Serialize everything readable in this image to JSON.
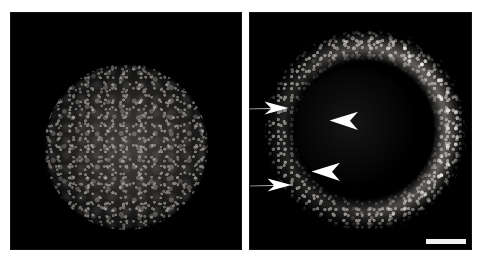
{
  "figure": {
    "caption_hidden": "",
    "background_color": "#ffffff",
    "width_px": 481,
    "height_px": 263
  },
  "panels": [
    {
      "id": "left",
      "data_name": "panel-left",
      "position_label": "left",
      "background_color": "#000000",
      "specimen": {
        "type": "solid-spheroid",
        "description": "densely packed fluorescently labelled nuclei filling the whole spheroid",
        "center_x_px": 125,
        "center_y_px": 145,
        "radius_px": 80,
        "signal_color": "#8a8682",
        "interior": "filled"
      },
      "markers": [],
      "scale_bar": null
    },
    {
      "id": "right",
      "data_name": "panel-right",
      "position_label": "right",
      "background_color": "#000000",
      "specimen": {
        "type": "hollow-ring",
        "description": "hollow cyst with punctate nuclei confined to the rim; lumen is dark",
        "center_x_px": 358,
        "center_y_px": 135,
        "outer_radius_px": 100,
        "rim_thickness_px": 16,
        "signal_color": "#c8c4c0",
        "brighter_arc": "right",
        "interior": "hollow"
      },
      "markers": [
        {
          "data_name": "arrow-upper",
          "glyph": "arrow",
          "direction": "right",
          "color": "#ffffff",
          "x_px": 247,
          "y_px": 99,
          "width_px": 42,
          "height_px": 18,
          "points_at": "rim of the cyst at the upper left"
        },
        {
          "data_name": "arrow-lower",
          "glyph": "arrow",
          "direction": "right",
          "color": "#ffffff",
          "x_px": 250,
          "y_px": 176,
          "width_px": 42,
          "height_px": 18,
          "points_at": "rim of the cyst at the lower left"
        },
        {
          "data_name": "arrowhead-upper",
          "glyph": "arrowhead",
          "direction": "left",
          "color": "#ffffff",
          "x_px": 329,
          "y_px": 111,
          "width_px": 30,
          "height_px": 20,
          "points_at": "upper lumen of the cyst"
        },
        {
          "data_name": "arrowhead-lower",
          "glyph": "arrowhead",
          "direction": "left",
          "color": "#ffffff",
          "x_px": 311,
          "y_px": 162,
          "width_px": 30,
          "height_px": 20,
          "points_at": "lower lumen of the cyst"
        }
      ],
      "scale_bar": {
        "data_name": "scale-bar",
        "label": "",
        "color": "#f2f2f2",
        "x_px": 426,
        "y_px": 239,
        "length_px": 40,
        "thickness_px": 5
      }
    }
  ]
}
